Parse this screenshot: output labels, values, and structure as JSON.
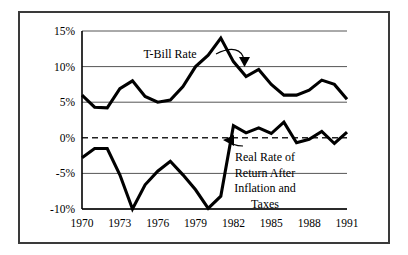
{
  "chart_data": {
    "type": "line",
    "title": "",
    "xlabel": "",
    "ylabel": "",
    "xlim": [
      1970,
      1991
    ],
    "ylim": [
      -10,
      15
    ],
    "grid": true,
    "gridlines_y": [
      15,
      10,
      5,
      0,
      -5,
      -10
    ],
    "zero_line_style": "dashed",
    "legend_position": "inline-annotations",
    "x": [
      1970,
      1971,
      1972,
      1973,
      1974,
      1975,
      1976,
      1977,
      1978,
      1979,
      1980,
      1981,
      1982,
      1983,
      1984,
      1985,
      1986,
      1987,
      1988,
      1989,
      1990,
      1991
    ],
    "ytick_labels": [
      "15%",
      "10%",
      "5%",
      "0%",
      "-5%",
      "-10%"
    ],
    "ytick_values": [
      15,
      10,
      5,
      0,
      -5,
      -10
    ],
    "xtick_labels": [
      "1970",
      "1973",
      "1976",
      "1979",
      "1982",
      "1985",
      "1988",
      "1991"
    ],
    "xtick_values": [
      1970,
      1973,
      1976,
      1979,
      1982,
      1985,
      1988,
      1991
    ],
    "series": [
      {
        "name": "T-Bill Rate",
        "label": "T-Bill Rate",
        "color": "#000000",
        "values": [
          6.0,
          4.3,
          4.2,
          6.9,
          8.0,
          5.8,
          5.0,
          5.3,
          7.2,
          10.0,
          11.6,
          14.0,
          10.7,
          8.6,
          9.6,
          7.5,
          6.0,
          6.0,
          6.7,
          8.1,
          7.5,
          5.4
        ]
      },
      {
        "name": "Real Rate of Return After Inflation and Taxes",
        "label": "Real Rate of Return After Inflation and Taxes",
        "color": "#000000",
        "values": [
          -2.8,
          -1.5,
          -1.5,
          -5.2,
          -10.0,
          -6.6,
          -4.7,
          -3.3,
          -5.2,
          -7.3,
          -9.9,
          -8.2,
          1.7,
          0.7,
          1.4,
          0.6,
          2.2,
          -0.7,
          -0.2,
          0.9,
          -0.8,
          0.8
        ]
      }
    ],
    "annotations": [
      {
        "name": "t-bill-rate-label",
        "text": "T-Bill Rate",
        "lines": [
          "T-Bill Rate"
        ],
        "points_to_series": "T-Bill Rate",
        "points_to_year": 1981
      },
      {
        "name": "real-rate-label",
        "text": "Real Rate of Return After Inflation and Taxes",
        "lines": [
          "Real Rate of",
          "Return After",
          "Inflation and",
          "Taxes"
        ],
        "points_to_series": "Real Rate of Return After Inflation and Taxes",
        "points_to_year": 1982
      }
    ]
  },
  "figure": {
    "border_color": "#3a3a3a",
    "background": "#ffffff",
    "line_color": "#000000",
    "grid_color": "#555555"
  }
}
